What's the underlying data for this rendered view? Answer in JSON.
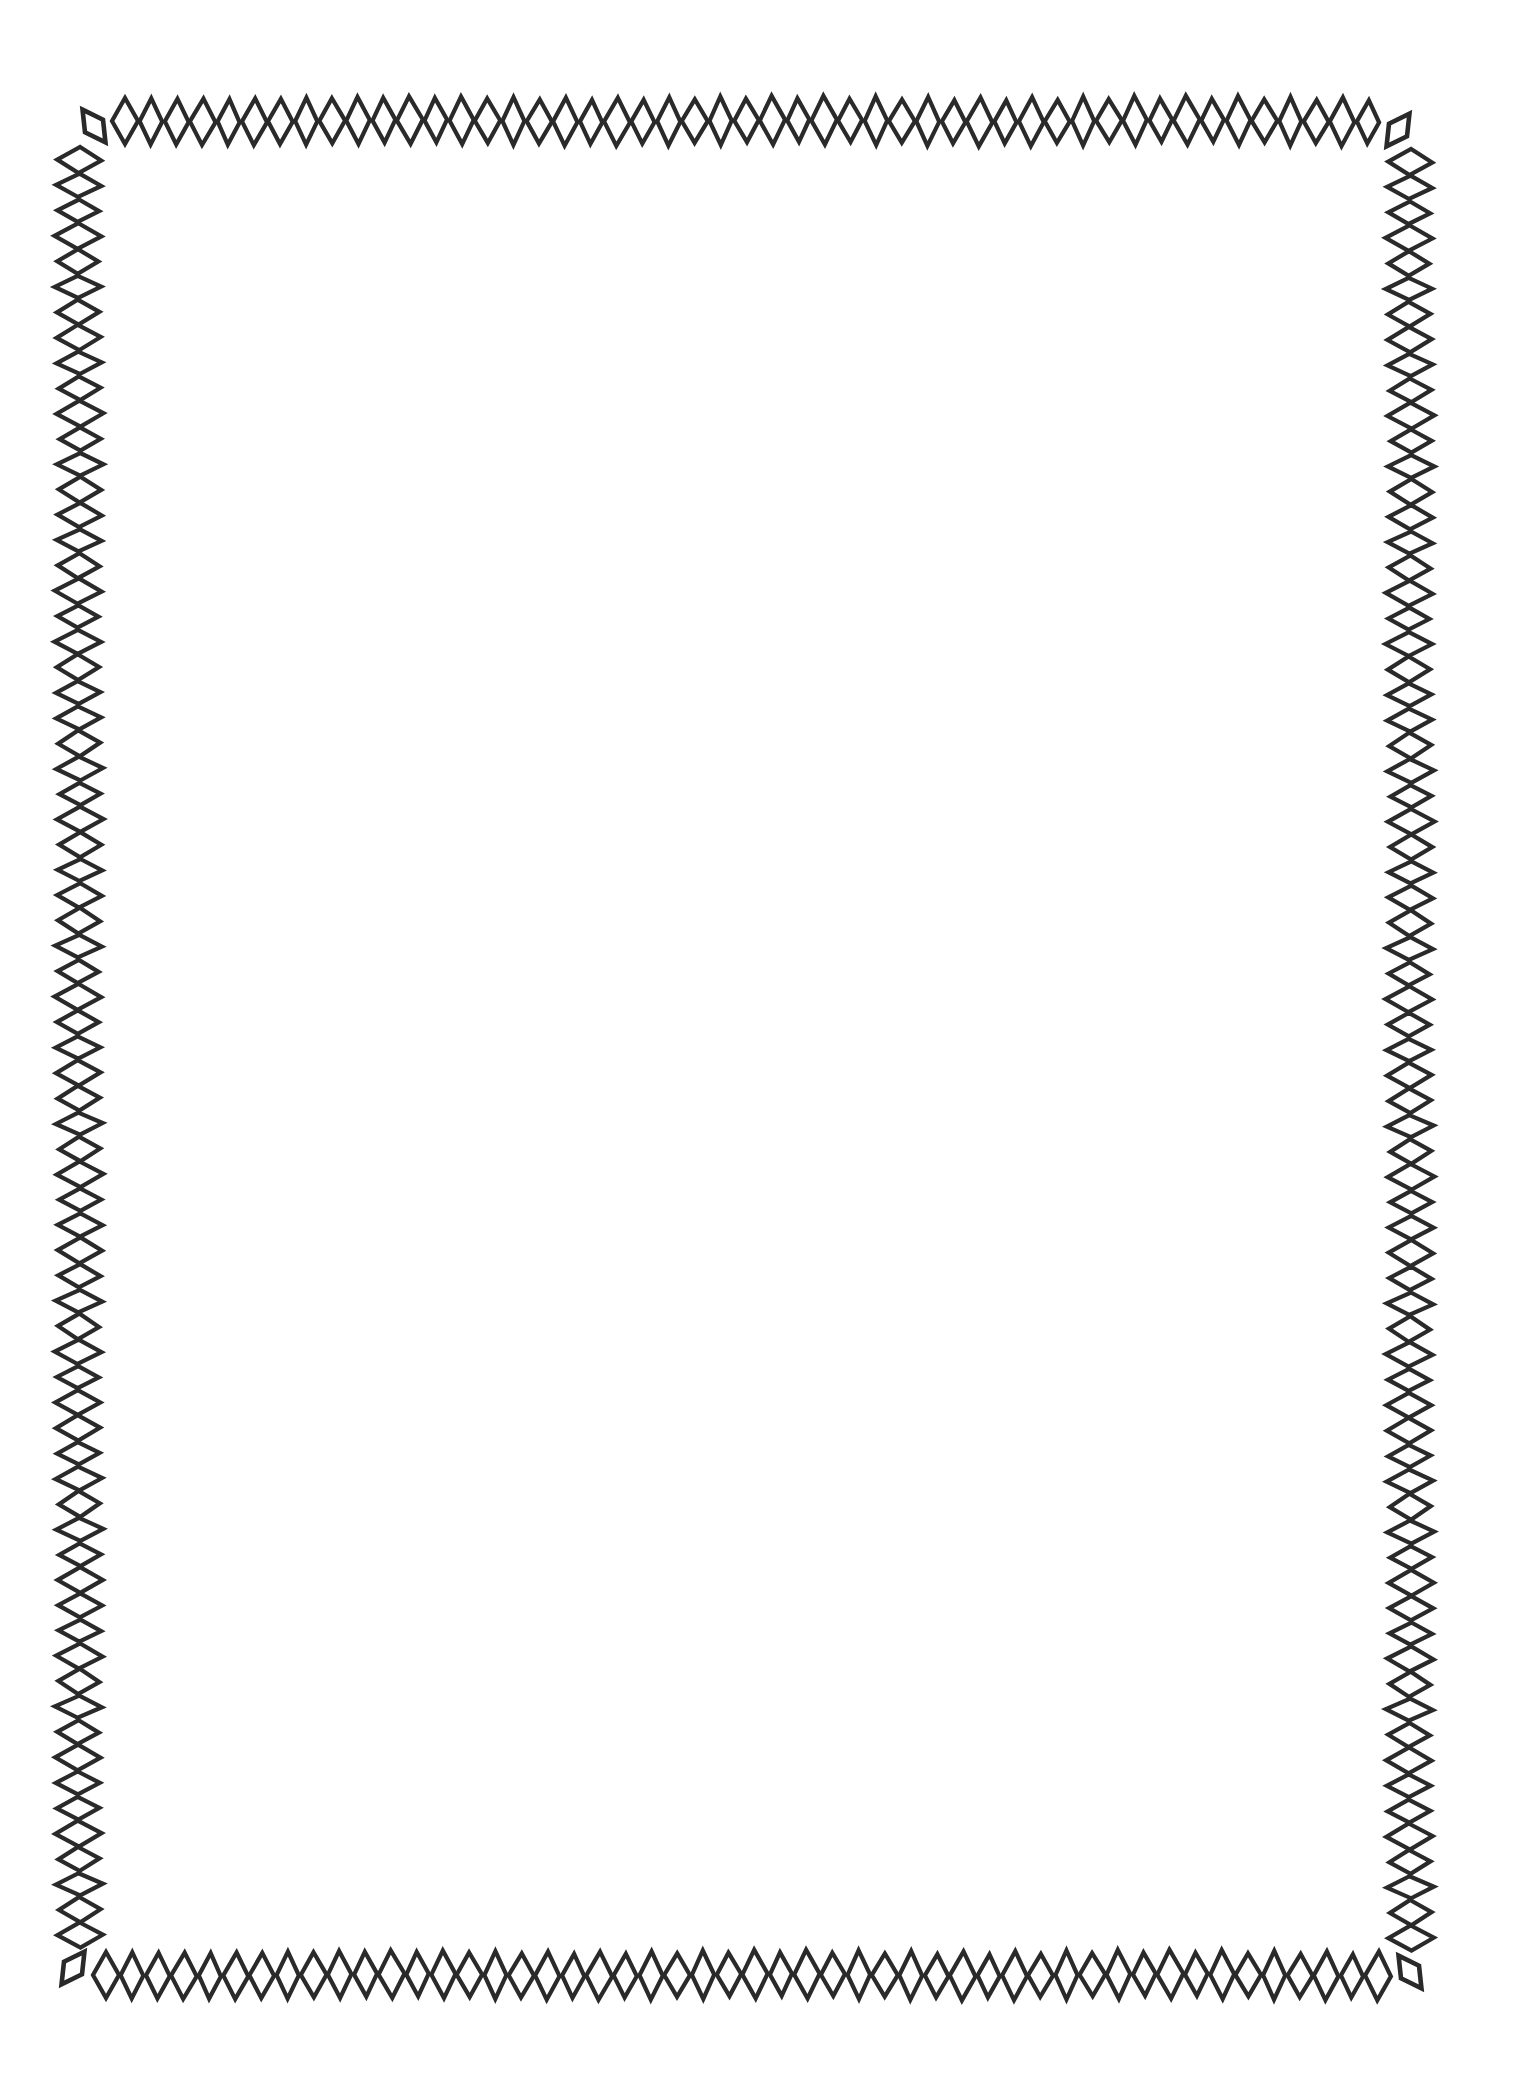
{
  "page": {
    "width": 1520,
    "height": 2074,
    "background": "#ffffff",
    "ink_color": "#2a2a2a"
  },
  "border": {
    "style": "hand-drawn diamond chain frame",
    "top": {
      "count": 49,
      "x_start": 125,
      "x_end": 1368,
      "y": 121,
      "diamond_w": 24,
      "diamond_h": 46
    },
    "bottom": {
      "count": 50,
      "x_start": 106,
      "x_end": 1378,
      "y": 1975,
      "diamond_w": 24,
      "diamond_h": 46
    },
    "left": {
      "count": 71,
      "x": 79,
      "y_start": 160,
      "y_end": 1935,
      "diamond_w": 44,
      "diamond_h": 24
    },
    "right": {
      "count": 71,
      "x": 1410,
      "y_start": 162,
      "y_end": 1938,
      "diamond_w": 44,
      "diamond_h": 24
    },
    "corners": [
      {
        "name": "top-left",
        "cx": 94,
        "cy": 126,
        "rotate": -35
      },
      {
        "name": "top-right",
        "cx": 1398,
        "cy": 130,
        "rotate": 35
      },
      {
        "name": "bottom-left",
        "cx": 73,
        "cy": 1968,
        "rotate": 35
      },
      {
        "name": "bottom-right",
        "cx": 1410,
        "cy": 1972,
        "rotate": -35
      }
    ]
  },
  "content": {
    "text": ""
  }
}
